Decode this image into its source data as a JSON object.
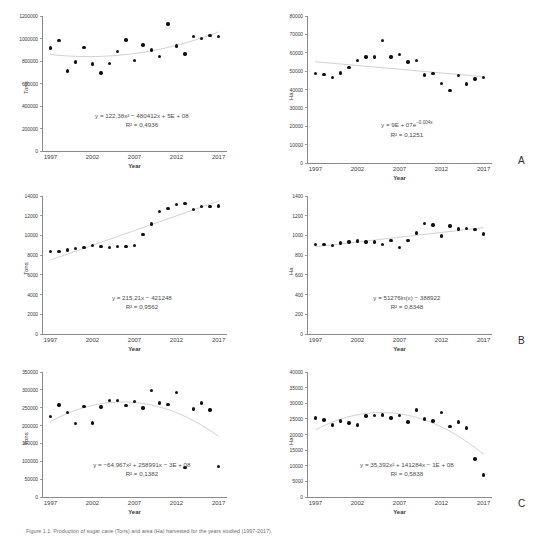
{
  "figure": {
    "caption": "Figure 1.1. Production of sugar cane (Tons) and area (Ha) harvested for the years studied (1997-2017).",
    "panel_letters": [
      "A",
      "B",
      "C"
    ]
  },
  "chart_data": [
    {
      "id": "panel-a-tons",
      "type": "scatter",
      "panel": "A",
      "title": "",
      "xlabel": "Year",
      "ylabel": "Tons",
      "xlim": [
        1996,
        2018
      ],
      "ylim": [
        0,
        1200000
      ],
      "xticks": [
        "1997",
        "2002",
        "2007",
        "2012",
        "2017"
      ],
      "yticks": [
        "0",
        "200000",
        "400000",
        "600000",
        "800000",
        "1000000",
        "1200000"
      ],
      "grid": false,
      "legend": "none",
      "equation": "y = 122,38x² − 480412x + 5E + 08",
      "r2": "R² = 0,4936",
      "trend_type": "polynomial",
      "x": [
        1997,
        1998,
        1999,
        2000,
        2001,
        2002,
        2003,
        2004,
        2005,
        2006,
        2007,
        2008,
        2009,
        2010,
        2011,
        2012,
        2013,
        2014,
        2015,
        2016,
        2017
      ],
      "values": [
        915000,
        982000,
        712000,
        792000,
        918000,
        772000,
        692000,
        778000,
        884000,
        986000,
        806000,
        942000,
        898000,
        840000,
        1128000,
        932000,
        862000,
        1018000,
        1000000,
        1028000,
        1018000
      ]
    },
    {
      "id": "panel-a-ha",
      "type": "scatter",
      "panel": "A",
      "title": "",
      "xlabel": "Year",
      "ylabel": "Ha",
      "xlim": [
        1996,
        2018
      ],
      "ylim": [
        0,
        80000
      ],
      "xticks": [
        "1997",
        "2002",
        "2007",
        "2012",
        "2017"
      ],
      "yticks": [
        "0",
        "10000",
        "20000",
        "30000",
        "40000",
        "50000",
        "60000",
        "70000",
        "80000"
      ],
      "grid": false,
      "legend": "none",
      "equation": "y = 9E + 07e",
      "equation_exponent": "−0,004x",
      "r2": "R² = 0,1251",
      "trend_type": "exponential",
      "x": [
        1997,
        1998,
        1999,
        2000,
        2001,
        2002,
        2003,
        2004,
        2005,
        2006,
        2007,
        2008,
        2009,
        2010,
        2011,
        2012,
        2013,
        2014,
        2015,
        2016,
        2017
      ],
      "values": [
        48800,
        48200,
        46600,
        48900,
        51900,
        55800,
        57700,
        57700,
        66700,
        57700,
        59000,
        55000,
        55800,
        47800,
        48600,
        43200,
        39600,
        47500,
        42900,
        45700,
        46400
      ]
    },
    {
      "id": "panel-b-tons",
      "type": "scatter",
      "panel": "B",
      "title": "",
      "xlabel": "Year",
      "ylabel": "Tons",
      "xlim": [
        1996,
        2018
      ],
      "ylim": [
        0,
        14000
      ],
      "xticks": [
        "1997",
        "2002",
        "2007",
        "2012",
        "2017"
      ],
      "yticks": [
        "0",
        "2000",
        "4000",
        "6000",
        "8000",
        "10000",
        "12000",
        "14000"
      ],
      "grid": false,
      "legend": "none",
      "equation": "y = 215,21x − 421248",
      "r2": "R² = 0,9562",
      "trend_type": "linear",
      "x": [
        1997,
        1998,
        1999,
        2000,
        2001,
        2002,
        2003,
        2004,
        2005,
        2006,
        2007,
        2008,
        2009,
        2010,
        2011,
        2012,
        2013,
        2014,
        2015,
        2016,
        2017
      ],
      "values": [
        8350,
        8400,
        8520,
        8700,
        8780,
        8950,
        8880,
        8800,
        8880,
        8860,
        8960,
        10100,
        11150,
        12450,
        12750,
        13150,
        13250,
        12600,
        12950,
        12950,
        13000
      ]
    },
    {
      "id": "panel-b-ha",
      "type": "scatter",
      "panel": "B",
      "title": "",
      "xlabel": "Year",
      "ylabel": "Ha",
      "xlim": [
        1996,
        2018
      ],
      "ylim": [
        0,
        1400
      ],
      "xticks": [
        "1997",
        "2002",
        "2007",
        "2012",
        "2017"
      ],
      "yticks": [
        "0",
        "200",
        "400",
        "600",
        "800",
        "1000",
        "1200",
        "1400"
      ],
      "grid": false,
      "legend": "none",
      "equation": "y = 51276ln(x) − 388922",
      "r2": "R² = 0,8348",
      "trend_type": "logarithmic",
      "x": [
        1997,
        1998,
        1999,
        2000,
        2001,
        2002,
        2003,
        2004,
        2005,
        2006,
        2007,
        2008,
        2009,
        2010,
        2011,
        2012,
        2013,
        2014,
        2015,
        2016,
        2017
      ],
      "values": [
        910,
        910,
        895,
        925,
        935,
        945,
        935,
        935,
        905,
        950,
        875,
        950,
        1025,
        1120,
        1105,
        995,
        1095,
        1065,
        1070,
        1060,
        1015
      ]
    },
    {
      "id": "panel-c-tons",
      "type": "scatter",
      "panel": "C",
      "title": "",
      "xlabel": "Year",
      "ylabel": "Tons",
      "xlim": [
        1996,
        2018
      ],
      "ylim": [
        0,
        350000
      ],
      "xticks": [
        "1997",
        "2002",
        "2007",
        "2012",
        "2017"
      ],
      "yticks": [
        "0",
        "50000",
        "100000",
        "150000",
        "200000",
        "250000",
        "300000",
        "350000"
      ],
      "grid": false,
      "legend": "none",
      "equation": "y = −64,967x² + 258991x − 3E + 08",
      "r2": "R² = 0,1382",
      "trend_type": "polynomial",
      "x": [
        1997,
        1998,
        1999,
        2000,
        2001,
        2002,
        2003,
        2004,
        2005,
        2006,
        2007,
        2008,
        2009,
        2010,
        2011,
        2012,
        2013,
        2014,
        2015,
        2016,
        2017
      ],
      "values": [
        226000,
        258000,
        237000,
        205000,
        254000,
        207000,
        252000,
        270000,
        270000,
        257000,
        268000,
        249000,
        299000,
        263000,
        259000,
        293000,
        82000,
        246000,
        263000,
        244000,
        85000
      ]
    },
    {
      "id": "panel-c-ha",
      "type": "scatter",
      "panel": "C",
      "title": "",
      "xlabel": "Year",
      "ylabel": "Ha",
      "xlim": [
        1996,
        2018
      ],
      "ylim": [
        0,
        40000
      ],
      "xticks": [
        "1997",
        "2002",
        "2007",
        "2012",
        "2017"
      ],
      "yticks": [
        "0",
        "5000",
        "10000",
        "15000",
        "20000",
        "25000",
        "30000",
        "35000",
        "40000"
      ],
      "grid": false,
      "legend": "none",
      "equation": "y = 35,392x² + 141284x − 1E + 08",
      "r2": "R² = 0,5838",
      "trend_type": "polynomial",
      "x": [
        1997,
        1998,
        1999,
        2000,
        2001,
        2002,
        2003,
        2004,
        2005,
        2006,
        2007,
        2008,
        2009,
        2010,
        2011,
        2012,
        2013,
        2014,
        2015,
        2016,
        2017
      ],
      "values": [
        25300,
        24700,
        23000,
        24300,
        23700,
        23100,
        25900,
        26000,
        26200,
        25300,
        26000,
        24000,
        27800,
        24900,
        24300,
        27000,
        22500,
        24000,
        22100,
        12100,
        7000
      ]
    }
  ]
}
